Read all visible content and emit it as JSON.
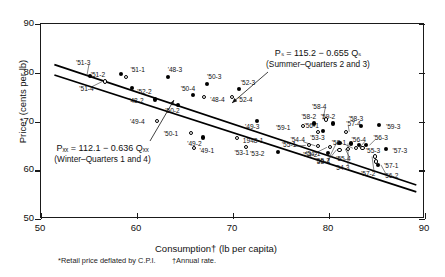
{
  "chart_data": {
    "type": "scatter",
    "title": "",
    "xlabel": "Consumption† (lb per capita)",
    "ylabel": "Price* (cents per lb)",
    "xlim": [
      50,
      90
    ],
    "ylim": [
      50,
      90
    ],
    "xticks": [
      50,
      60,
      70,
      80,
      90
    ],
    "yticks": [
      50,
      60,
      70,
      80,
      90
    ],
    "grid": false,
    "legend": "none",
    "footnotes": [
      "*Retail price deflated by C.P.I.",
      "†Annual rate."
    ],
    "annotations": [
      {
        "name": "summer-equation",
        "equation": "Pₛ = 115.2 − 0.655 Qₛ",
        "subtitle": "(Summer–Quarters 2 and 3)"
      },
      {
        "name": "winter-equation",
        "equation": "Pₓₓ = 112.1 − 0.636 Qₓₓ",
        "subtitle": "(Winter–Quarters 1 and 4)"
      }
    ],
    "fit_lines": [
      {
        "name": "summer-line",
        "intercept": 115.2,
        "slope": -0.655,
        "x_start": 51.5,
        "x_end": 89.2,
        "marker": "filled"
      },
      {
        "name": "winter-line",
        "intercept": 112.1,
        "slope": -0.636,
        "x_start": 51.5,
        "x_end": 89.2,
        "marker": "open"
      }
    ],
    "series": [
      {
        "name": "Summer (Quarters 2 and 3)",
        "marker": "filled",
        "points": [
          {
            "label": "'51-3",
            "x": 55.2,
            "y": 79.2
          },
          {
            "label": "'51-2",
            "x": 58.4,
            "y": 79.6
          },
          {
            "label": "'48-3",
            "x": 63.3,
            "y": 79.0
          },
          {
            "label": "'50-3",
            "x": 67.4,
            "y": 77.5
          },
          {
            "label": "'52-3",
            "x": 70.7,
            "y": 76.4
          },
          {
            "label": "'52-2",
            "x": 59.6,
            "y": 76.6
          },
          {
            "label": "'50-4",
            "x": 65.9,
            "y": 75.2
          },
          {
            "label": "'48-2",
            "x": 62.0,
            "y": 74.3
          },
          {
            "label": "'50-2",
            "x": 64.4,
            "y": 73.2
          },
          {
            "label": "'49-3",
            "x": 72.6,
            "y": 69.9
          },
          {
            "label": "'49-2",
            "x": 67.0,
            "y": 66.5
          },
          {
            "label": "'58-2",
            "x": 78.5,
            "y": 69.4
          },
          {
            "label": "'59-2",
            "x": 80.5,
            "y": 69.4
          },
          {
            "label": "'58-3",
            "x": 83.4,
            "y": 68.9
          },
          {
            "label": "'59-3",
            "x": 85.3,
            "y": 69.0
          },
          {
            "label": "'53-3",
            "x": 79.5,
            "y": 67.9
          },
          {
            "label": "'53-2",
            "x": 74.8,
            "y": 63.5
          },
          {
            "label": "'57-3",
            "x": 86.0,
            "y": 64.1
          },
          {
            "label": "'55-2",
            "x": 81.2,
            "y": 65.4
          },
          {
            "label": "'54-3",
            "x": 82.4,
            "y": 65.3
          },
          {
            "label": "'54-2",
            "x": 80.0,
            "y": 63.3
          },
          {
            "label": "'56-2",
            "x": 85.2,
            "y": 60.9
          },
          {
            "label": "'56-3",
            "x": 84.0,
            "y": 64.9
          },
          {
            "label": "'55-3",
            "x": 83.2,
            "y": 64.9
          }
        ]
      },
      {
        "name": "Winter (Quarters 1 and 4)",
        "marker": "open",
        "points": [
          {
            "label": "'51-1",
            "x": 59.0,
            "y": 79.0
          },
          {
            "label": "'51-4",
            "x": 56.8,
            "y": 78.0
          },
          {
            "label": "'52-4",
            "x": 70.0,
            "y": 74.8
          },
          {
            "label": "'48-4",
            "x": 67.1,
            "y": 74.8
          },
          {
            "label": "'49-4",
            "x": 62.2,
            "y": 69.9
          },
          {
            "label": "'50-1",
            "x": 65.7,
            "y": 67.4
          },
          {
            "label": "1948-1",
            "x": 70.5,
            "y": 66.4
          },
          {
            "label": "'49-1",
            "x": 66.0,
            "y": 64.3
          },
          {
            "label": "'53-1",
            "x": 71.5,
            "y": 64.6
          },
          {
            "label": "'59-1",
            "x": 77.4,
            "y": 68.8
          },
          {
            "label": "'56-1",
            "x": 79.0,
            "y": 67.6
          },
          {
            "label": "'57-4",
            "x": 81.9,
            "y": 67.7
          },
          {
            "label": "'55-1",
            "x": 78.0,
            "y": 64.9
          },
          {
            "label": "'54-4",
            "x": 79.0,
            "y": 64.8
          },
          {
            "label": "'54-1",
            "x": 80.2,
            "y": 64.5
          },
          {
            "label": "'53-4",
            "x": 81.2,
            "y": 64.0
          },
          {
            "label": "'56-4",
            "x": 83.6,
            "y": 64.4
          },
          {
            "label": "'57-2",
            "x": 84.9,
            "y": 62.6
          },
          {
            "label": "'57-1",
            "x": 85.0,
            "y": 61.6
          },
          {
            "label": "'55-4",
            "x": 82.1,
            "y": 64.2
          },
          {
            "label": "'58-4",
            "x": 79.8,
            "y": 70.2
          },
          {
            "label": "'58-1",
            "x": 82.9,
            "y": 64.3
          }
        ]
      }
    ]
  }
}
